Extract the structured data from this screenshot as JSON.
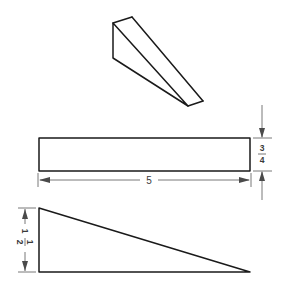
{
  "colors": {
    "background": "#ffffff",
    "object_line": "#1a1a1a",
    "dimension_line": "#6a6a6a",
    "dimension_text": "#3a3a3a"
  },
  "views": {
    "isometric": {
      "label": "Wedge pictorial view"
    },
    "top_view": {
      "label": "Top view",
      "width_dimension": "5",
      "height_dimension": {
        "numerator": "3",
        "denominator": "4"
      }
    },
    "front_view": {
      "label": "Front view",
      "height_dimension": {
        "whole": "1",
        "numerator": "1",
        "denominator": "2"
      }
    }
  }
}
